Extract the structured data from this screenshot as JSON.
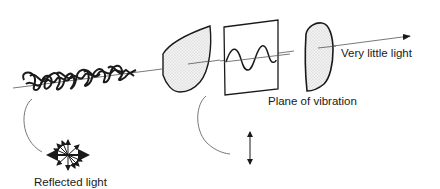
{
  "diagram": {
    "labels": {
      "output": "Very little light",
      "plane": "Plane of vibration",
      "reflected": "Reflected light"
    },
    "elements": [
      {
        "id": "unpolarized-light",
        "description": "tangled scribble representing unpolarized light along beam"
      },
      {
        "id": "first-filter",
        "description": "stippled lens-shaped polarizing filter"
      },
      {
        "id": "plane-panel",
        "description": "rectangular panel showing sine wave in plane of vibration"
      },
      {
        "id": "second-filter",
        "description": "stippled lens-shaped polarizing filter (crossed)"
      },
      {
        "id": "beam-arrow",
        "description": "light beam line ending in arrowhead"
      },
      {
        "id": "reflected-star",
        "description": "multi-directional arrows for reflected light"
      },
      {
        "id": "vertical-double-arrow",
        "description": "vertical vibration direction indicator"
      }
    ],
    "colors": {
      "ink": "#1a1a1a",
      "stipple": "#e6e6e6",
      "beam": "#555555"
    }
  }
}
